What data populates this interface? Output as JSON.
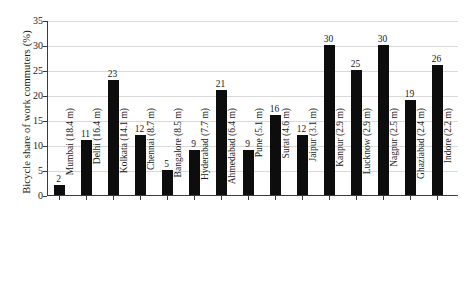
{
  "chart_data": {
    "type": "bar",
    "title": "",
    "subtitle": "",
    "xlabel": "",
    "ylabel": "Bicycle share of work commuters (%)",
    "ylim": [
      0,
      35
    ],
    "yticks": [
      0,
      5,
      10,
      15,
      20,
      25,
      30,
      35
    ],
    "ytick_labels": [
      "0",
      "5",
      "10",
      "15",
      "20",
      "25",
      "30",
      "35"
    ],
    "grid": "horizontal",
    "legend": "none",
    "bar_color": "#0d0d0d",
    "categories": [
      "Mumbai (18.4 m)",
      "Delhi (16.4 m)",
      "Kolkata (14.1 m)",
      "Chennai (8.7 m)",
      "Bangalore (8.5 m)",
      "Hyderabad (7.7 m)",
      "Ahmedabad (6.4 m)",
      "Pune (5.1 m)",
      "Surat (4.6 m)",
      "Jaipur (3.1 m)",
      "Kanpur (2.9 m)",
      "Lucknow (2.9 m)",
      "Nagpur (2.5 m)",
      "Ghaziabad (2.4 m)",
      "Indore  (2.2 m)"
    ],
    "values": [
      2,
      11,
      23,
      12,
      5,
      9,
      21,
      9,
      16,
      12,
      30,
      25,
      30,
      19,
      26
    ],
    "value_labels": [
      "2",
      "11",
      "23",
      "12",
      "5",
      "9",
      "21",
      "9",
      "16",
      "12",
      "30",
      "25",
      "30",
      "19",
      "26"
    ]
  }
}
